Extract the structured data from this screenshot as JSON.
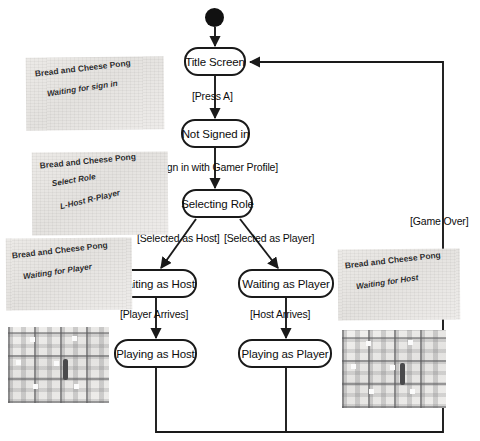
{
  "diagram": {
    "initial_node": "initial-state-dot",
    "states": [
      {
        "id": "title-screen",
        "label": "Title Screen"
      },
      {
        "id": "not-signed-in",
        "label": "Not Signed in"
      },
      {
        "id": "selecting-role",
        "label": "Selecting Role"
      },
      {
        "id": "waiting-as-host",
        "label": "Waiting as Host"
      },
      {
        "id": "waiting-as-player",
        "label": "Waiting as Player"
      },
      {
        "id": "playing-as-host",
        "label": "Playing as Host"
      },
      {
        "id": "playing-as-player",
        "label": "Playing as Player"
      }
    ],
    "transitions": [
      {
        "from": "title-screen",
        "to": "not-signed-in",
        "label": "[Press A]"
      },
      {
        "from": "not-signed-in",
        "to": "selecting-role",
        "label": "[Sign in with Gamer Profile]"
      },
      {
        "from": "selecting-role",
        "to": "waiting-as-host",
        "label": "[Selected as Host]"
      },
      {
        "from": "selecting-role",
        "to": "waiting-as-player",
        "label": "[Selected as Player]"
      },
      {
        "from": "waiting-as-host",
        "to": "playing-as-host",
        "label": "[Player Arrives]"
      },
      {
        "from": "waiting-as-player",
        "to": "playing-as-player",
        "label": "[Host Arrives]"
      },
      {
        "from": "playing-as-host",
        "to": "title-screen",
        "label": "[Game Over]"
      },
      {
        "from": "playing-as-player",
        "to": "title-screen",
        "label": "[Game Over]"
      }
    ],
    "colors": {
      "stroke": "#1a1a1a",
      "text": "#0d0d0d",
      "node_fill": "#ffffff",
      "screenshot_bg": "#e9e8e6"
    }
  },
  "screenshots": [
    {
      "id": "shot-waiting-for-sign-in",
      "title": "Bread and Cheese Pong",
      "lines": [
        "Waiting for sign in"
      ]
    },
    {
      "id": "shot-select-role",
      "title": "Bread and Cheese Pong",
      "lines": [
        "Select Role",
        "L-Host R-Player"
      ]
    },
    {
      "id": "shot-waiting-for-player",
      "title": "Bread and Cheese Pong",
      "lines": [
        "Waiting for Player"
      ]
    },
    {
      "id": "shot-waiting-for-host",
      "title": "Bread and Cheese Pong",
      "lines": [
        "Waiting for Host"
      ]
    },
    {
      "id": "shot-gameplay-host",
      "title": "",
      "lines": []
    },
    {
      "id": "shot-gameplay-player",
      "title": "",
      "lines": []
    }
  ]
}
